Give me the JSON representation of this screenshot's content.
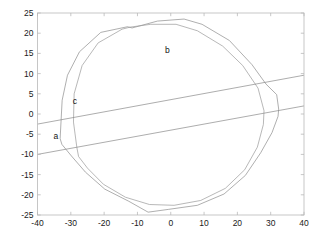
{
  "chart_data": {
    "type": "line",
    "title": "",
    "xlabel": "",
    "ylabel": "",
    "xlim": [
      -40,
      40
    ],
    "ylim": [
      -25,
      25
    ],
    "grid": false,
    "legend": "none",
    "xticks": [
      "-40",
      "-30",
      "-20",
      "-10",
      "0",
      "10",
      "20",
      "30",
      "40"
    ],
    "xtick_values": [
      -40,
      -30,
      -20,
      -10,
      0,
      10,
      20,
      30,
      40
    ],
    "yticks": [
      "25",
      "20",
      "15",
      "10",
      "5",
      "0",
      "-5",
      "-10",
      "-15",
      "-20",
      "-25"
    ],
    "ytick_values": [
      25,
      20,
      15,
      10,
      5,
      0,
      -5,
      -10,
      -15,
      -20,
      -25
    ],
    "annotations": [
      {
        "text": "a",
        "x": -34.5,
        "y": -6.2
      },
      {
        "text": "b",
        "x": -1.0,
        "y": 15.2
      },
      {
        "text": "c",
        "x": -28.8,
        "y": 2.4
      }
    ],
    "series": [
      {
        "name": "outer-polygon",
        "color": "#8c8c8c",
        "closed": true,
        "points": [
          [
            -33.2,
            -6.0
          ],
          [
            -32.6,
            3.4
          ],
          [
            -31.0,
            9.6
          ],
          [
            -27.4,
            15.4
          ],
          [
            -21.0,
            20.2
          ],
          [
            -13.0,
            21.6
          ],
          [
            -11.6,
            21.3
          ],
          [
            -4.0,
            23.0
          ],
          [
            4.0,
            23.5
          ],
          [
            9.4,
            22.2
          ],
          [
            17.6,
            18.2
          ],
          [
            24.4,
            12.2
          ],
          [
            28.6,
            7.4
          ],
          [
            31.8,
            4.8
          ],
          [
            32.4,
            1.2
          ],
          [
            32.2,
            -0.6
          ],
          [
            30.4,
            -4.6
          ],
          [
            27.0,
            -9.6
          ],
          [
            22.4,
            -15.2
          ],
          [
            16.0,
            -19.8
          ],
          [
            8.0,
            -22.6
          ],
          [
            -0.6,
            -23.6
          ],
          [
            -6.8,
            -24.3
          ],
          [
            -12.6,
            -21.6
          ],
          [
            -19.8,
            -18.6
          ],
          [
            -25.6,
            -14.4
          ],
          [
            -29.8,
            -10.4
          ],
          [
            -32.6,
            -7.6
          ]
        ]
      },
      {
        "name": "inner-polygon",
        "color": "#9a9a9a",
        "closed": true,
        "points": [
          [
            -28.2,
            -8.2
          ],
          [
            -29.2,
            -2.0
          ],
          [
            -29.0,
            5.0
          ],
          [
            -26.6,
            12.0
          ],
          [
            -21.8,
            17.6
          ],
          [
            -14.6,
            21.0
          ],
          [
            -12.2,
            21.5
          ],
          [
            -6.0,
            22.2
          ],
          [
            1.6,
            22.2
          ],
          [
            8.0,
            20.6
          ],
          [
            15.6,
            16.8
          ],
          [
            21.6,
            12.0
          ],
          [
            26.2,
            6.4
          ],
          [
            28.0,
            0.8
          ],
          [
            27.8,
            -2.6
          ],
          [
            26.0,
            -8.2
          ],
          [
            22.2,
            -13.8
          ],
          [
            16.4,
            -18.4
          ],
          [
            9.0,
            -21.4
          ],
          [
            1.0,
            -22.6
          ],
          [
            -6.4,
            -22.4
          ],
          [
            -13.6,
            -20.6
          ],
          [
            -20.2,
            -17.4
          ],
          [
            -25.0,
            -13.4
          ],
          [
            -27.6,
            -10.6
          ]
        ]
      },
      {
        "name": "band-line-upper",
        "color": "#8a8a8a",
        "closed": false,
        "points": [
          [
            -40,
            -2.5
          ],
          [
            40,
            9.6
          ]
        ]
      },
      {
        "name": "band-line-lower",
        "color": "#8a8a8a",
        "closed": false,
        "points": [
          [
            -40,
            -10.0
          ],
          [
            40,
            2.0
          ]
        ]
      }
    ]
  },
  "axes": {
    "frame_color": "#b9b9b9",
    "background": "#ffffff"
  }
}
